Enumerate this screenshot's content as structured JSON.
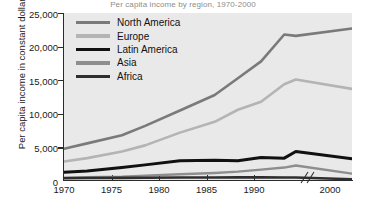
{
  "title": "Per capita income by region, 1970-2000",
  "axes": {
    "ylabel": "Per capita income in constant dollars",
    "yticks": [
      "25,000",
      "20,000",
      "15,000",
      "10,000",
      "5,000",
      "0"
    ],
    "xticks": [
      "1970",
      "1975",
      "1980",
      "1985",
      "1990",
      "2000"
    ],
    "axis_break_icon": "axis-break-slashes"
  },
  "legend": {
    "items": [
      {
        "label": "North America",
        "color": "#7a7a7a"
      },
      {
        "label": "Europe",
        "color": "#b4b4b4"
      },
      {
        "label": "Latin America",
        "color": "#111111"
      },
      {
        "label": "Asia",
        "color": "#8e8e8e"
      },
      {
        "label": "Africa",
        "color": "#2e2e2e"
      }
    ]
  },
  "chart_data": {
    "type": "line",
    "title": "Per capita income by region, 1970-2000",
    "xlabel": "",
    "ylabel": "Per capita income in constant dollars",
    "ylim": [
      0,
      25000
    ],
    "xlim": [
      1970,
      2000
    ],
    "ytick_values": [
      0,
      5000,
      10000,
      15000,
      20000,
      25000
    ],
    "xtick_values": [
      1970,
      1975,
      1980,
      1985,
      1990,
      2000
    ],
    "grid": false,
    "legend_position": "top-left",
    "axis_break": {
      "between": [
        1990,
        2000
      ],
      "note": "broken x-axis after 1990"
    },
    "x": [
      1970,
      1972,
      1975,
      1977,
      1980,
      1983,
      1985,
      1987,
      1989,
      1990,
      2000
    ],
    "series": [
      {
        "name": "North America",
        "color": "#7a7a7a",
        "values": [
          4800,
          5600,
          6800,
          8200,
          10500,
          12800,
          15300,
          17800,
          21800,
          21600,
          22700
        ]
      },
      {
        "name": "Europe",
        "color": "#b4b4b4",
        "values": [
          2900,
          3400,
          4400,
          5300,
          7200,
          8800,
          10600,
          11800,
          14400,
          15100,
          13700
        ]
      },
      {
        "name": "Latin America",
        "color": "#111111",
        "values": [
          1300,
          1500,
          2000,
          2400,
          3000,
          3100,
          3000,
          3500,
          3400,
          4400,
          3300
        ]
      },
      {
        "name": "Asia",
        "color": "#8e8e8e",
        "values": [
          500,
          550,
          650,
          800,
          1000,
          1200,
          1400,
          1700,
          2000,
          2300,
          1100
        ]
      },
      {
        "name": "Africa",
        "color": "#2e2e2e",
        "values": [
          420,
          440,
          470,
          490,
          520,
          530,
          540,
          540,
          530,
          520,
          260
        ]
      }
    ]
  }
}
